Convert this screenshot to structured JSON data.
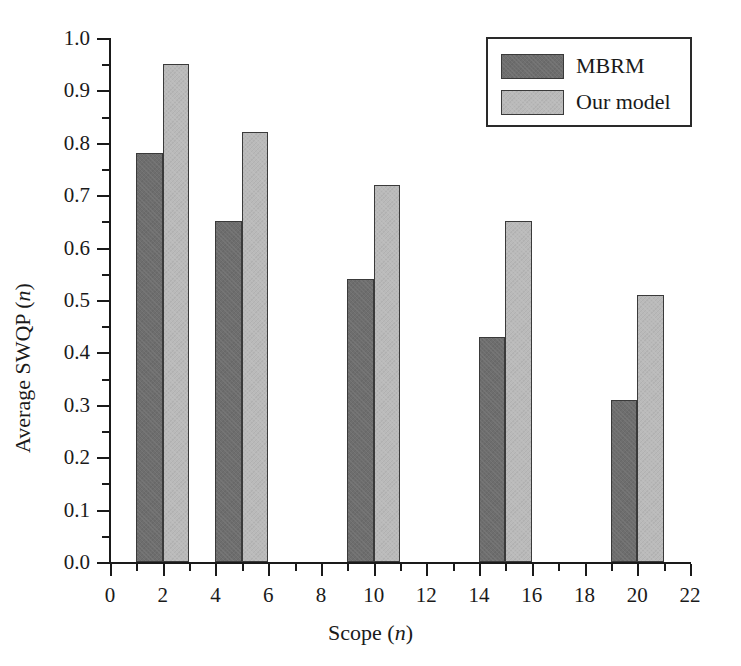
{
  "chart_data": {
    "type": "bar",
    "title": "",
    "subtitle": "",
    "xlabel": "Scope (n)",
    "xlabel_plain": "Scope (",
    "xlabel_italic": "n",
    "xlabel_tail": ")",
    "ylabel": "Average SWQP (n)",
    "ylabel_plain": "Average SWQP (",
    "ylabel_italic": "n",
    "ylabel_tail": ")",
    "xlim": [
      0,
      22
    ],
    "ylim": [
      0.0,
      1.0
    ],
    "grid": false,
    "legend_position": "top-right",
    "x_major_ticks": [
      0,
      2,
      4,
      6,
      8,
      10,
      12,
      14,
      16,
      18,
      20,
      22
    ],
    "x_minor_ticks": [
      1,
      3,
      5,
      7,
      9,
      11,
      13,
      15,
      17,
      19,
      21
    ],
    "x_tick_labels": [
      "0",
      "2",
      "4",
      "6",
      "8",
      "10",
      "12",
      "14",
      "16",
      "18",
      "20",
      "22"
    ],
    "y_major_ticks": [
      0.0,
      0.1,
      0.2,
      0.3,
      0.4,
      0.5,
      0.6,
      0.7,
      0.8,
      0.9,
      1.0
    ],
    "y_minor_ticks": [
      0.05,
      0.15,
      0.25,
      0.35,
      0.45,
      0.55,
      0.65,
      0.75,
      0.85,
      0.95
    ],
    "y_tick_labels": [
      "0.0",
      "0.1",
      "0.2",
      "0.3",
      "0.4",
      "0.5",
      "0.6",
      "0.7",
      "0.8",
      "0.9",
      "1.0"
    ],
    "categories": [
      "2",
      "5",
      "10",
      "15",
      "20"
    ],
    "series": [
      {
        "name": "MBRM",
        "color": "#6e6e6e",
        "values": [
          0.78,
          0.65,
          0.54,
          0.43,
          0.31
        ],
        "x_left": [
          1,
          4,
          9,
          14,
          19
        ],
        "x_right": [
          2,
          5,
          10,
          15,
          20
        ]
      },
      {
        "name": "Our model",
        "color": "#bababa",
        "values": [
          0.95,
          0.82,
          0.72,
          0.65,
          0.51
        ],
        "x_left": [
          2,
          5,
          10,
          15,
          20
        ],
        "x_right": [
          3,
          6,
          11,
          16,
          21
        ]
      }
    ]
  },
  "legend": {
    "entries": [
      {
        "label": "MBRM"
      },
      {
        "label": "Our model"
      }
    ]
  },
  "colors": {
    "mbrm": "#6e6e6e",
    "our_model": "#bababa",
    "axis": "#1a1a1a",
    "background": "#ffffff"
  }
}
